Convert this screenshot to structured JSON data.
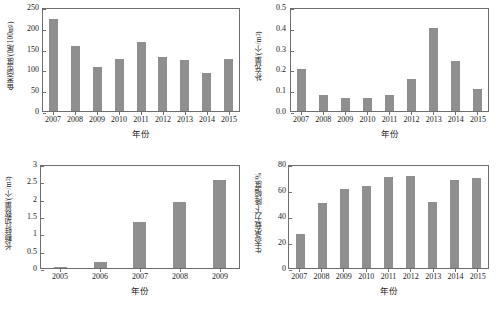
{
  "figure": {
    "panel_count": 4,
    "bar_color": "#8f8f8f",
    "axis_color": "#6e6e6e",
    "background": "#ffffff"
  },
  "chart_data": [
    {
      "id": "panel-a-fish-density",
      "type": "bar",
      "title": "",
      "xlabel": "年份",
      "ylabel": "鱼类密度/(尾/100m²)",
      "ylabel_base": "鱼类密度/(尾/100m",
      "ylabel_sup": "2",
      "ylabel_tail": ")",
      "categories": [
        "2007",
        "2008",
        "2009",
        "2010",
        "2011",
        "2012",
        "2013",
        "2014",
        "2015"
      ],
      "values": [
        220,
        157,
        105,
        124,
        165,
        131,
        123,
        91,
        125
      ],
      "ylim": [
        0,
        250
      ],
      "yticks": [
        0,
        50,
        100,
        150,
        200,
        250
      ],
      "ytick_labels": [
        "0",
        "50",
        "100",
        "150",
        "200",
        "250"
      ],
      "grid": false,
      "legend": "none"
    },
    {
      "id": "panel-b-recruitment",
      "type": "bar",
      "title": "",
      "xlabel": "年份",
      "ylabel": "补充量/(个/m²)",
      "ylabel_base": "补充量/(个/m",
      "ylabel_sup": "2",
      "ylabel_tail": ")",
      "categories": [
        "2007",
        "2008",
        "2009",
        "2010",
        "2011",
        "2012",
        "2013",
        "2014",
        "2015"
      ],
      "values": [
        0.2,
        0.075,
        0.062,
        0.063,
        0.078,
        0.155,
        0.4,
        0.24,
        0.105
      ],
      "ylim": [
        0,
        0.5
      ],
      "yticks": [
        0,
        0.1,
        0.2,
        0.3,
        0.4,
        0.5
      ],
      "ytick_labels": [
        "0.0",
        "0.1",
        "0.2",
        "0.3",
        "0.4",
        "0.5"
      ],
      "grid": false,
      "legend": "none"
    },
    {
      "id": "panel-c-juvenile-count",
      "type": "bar",
      "title": "",
      "xlabel": "年份",
      "ylabel": "长额蚌幼数量/(个/m²)",
      "ylabel_base": "长额蚌幼数量/(个/m",
      "ylabel_sup": "2",
      "ylabel_tail": ")",
      "categories": [
        "2005",
        "2006",
        "2007",
        "2008",
        "2009"
      ],
      "values": [
        0.02,
        0.18,
        1.32,
        1.9,
        2.55
      ],
      "ylim": [
        0,
        3
      ],
      "yticks": [
        0,
        0.5,
        1,
        1.5,
        2,
        2.5,
        3
      ],
      "ytick_labels": [
        "0",
        "0.5",
        "1",
        "1.5",
        "2",
        "2.5",
        "3"
      ],
      "grid": false,
      "legend": "none"
    },
    {
      "id": "panel-d-carrying-capacity-decline",
      "type": "bar",
      "title": "",
      "xlabel": "年份",
      "ylabel": "生态承载力下降幅度/%",
      "ylabel_base": "生态承载力下降幅度/%",
      "ylabel_sup": "",
      "ylabel_tail": "",
      "categories": [
        "2007",
        "2008",
        "2009",
        "2010",
        "2011",
        "2012",
        "2013",
        "2014",
        "2015"
      ],
      "values": [
        26,
        50,
        61,
        63,
        70,
        71,
        51,
        68,
        69
      ],
      "ylim": [
        0,
        80
      ],
      "yticks": [
        0,
        20,
        40,
        60,
        80
      ],
      "ytick_labels": [
        "0",
        "20",
        "40",
        "60",
        "80"
      ],
      "grid": false,
      "legend": "none"
    }
  ]
}
